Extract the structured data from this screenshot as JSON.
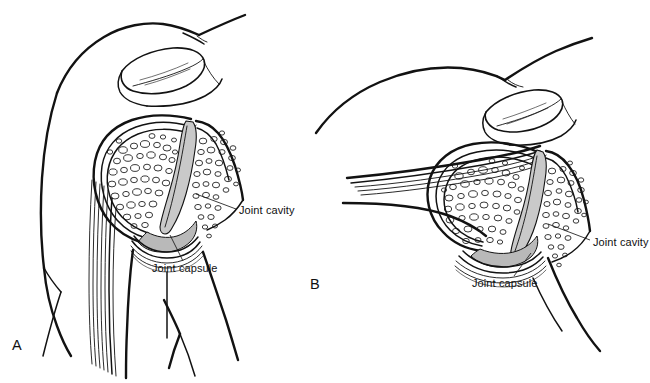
{
  "figure": {
    "background_color": "#ffffff",
    "line_color": "#121212",
    "cavity_color": "#c9c9c9",
    "capsule_color": "#b9b9b9",
    "width": 650,
    "height": 383
  },
  "panels": [
    {
      "letter": "A",
      "letter_x": 12,
      "letter_y": 345,
      "description": "arm adducted, hanging at side",
      "labels": [
        {
          "text": "Joint cavity",
          "x": 239,
          "y": 212,
          "leader": "M236,209 L196,194"
        },
        {
          "text": "Joint capsule",
          "x": 152,
          "y": 270,
          "leader": "M182,262 L168,234"
        }
      ]
    },
    {
      "letter": "B",
      "letter_x": 310,
      "letter_y": 284,
      "description": "arm abducted, raised horizontally",
      "labels": [
        {
          "text": "Joint cavity",
          "x": 593,
          "y": 244,
          "leader": "M590,240 L548,224"
        },
        {
          "text": "Joint capsule",
          "x": 472,
          "y": 285,
          "leader": "M513,277 L530,253"
        }
      ]
    }
  ]
}
